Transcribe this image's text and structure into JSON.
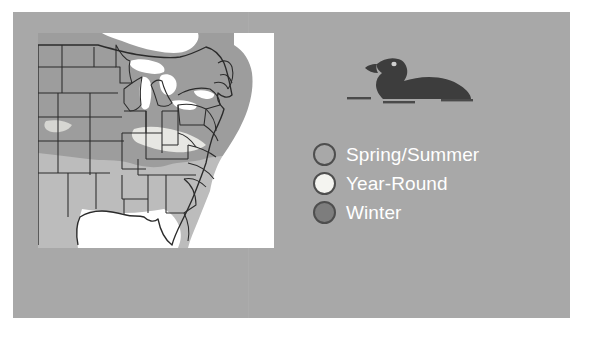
{
  "figure": {
    "kind": "bird-range-map-figure",
    "panel_color": "#a8a8a8",
    "map_background": "#ffffff"
  },
  "bird": {
    "name": "loon-silhouette",
    "description": "Common Loon swimming on water",
    "body_color": "#3d3d3d",
    "eye_color": "#cfcfcf",
    "water_line_color": "#4a4a4a"
  },
  "map": {
    "name": "united-states-range-map",
    "region": "Eastern and Central United States",
    "outline_color": "#2b2b2b",
    "regions": [
      {
        "season": "Spring/Summer",
        "color": "#a0a0a0"
      },
      {
        "season": "Year-Round",
        "color": "#f2f2f2"
      },
      {
        "season": "Winter",
        "color": "#b9b9b9"
      }
    ]
  },
  "legend": {
    "name": "range-legend",
    "items": [
      {
        "label": "Spring/Summer",
        "color": "#a8a8a8",
        "border": "#4e4e4e"
      },
      {
        "label": "Year-Round",
        "color": "#f4f4f0",
        "border": "#4e4e4e"
      },
      {
        "label": "Winter",
        "color": "#7d7d7d",
        "border": "#4e4e4e"
      }
    ]
  }
}
